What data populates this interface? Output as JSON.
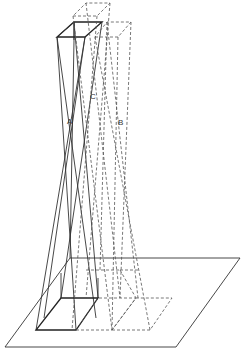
{
  "diagram": {
    "labels": {
      "a": "A",
      "b": "B",
      "c": "C"
    },
    "colors": {
      "line": "#333333",
      "dashed": "#555555",
      "background": "#ffffff"
    }
  }
}
